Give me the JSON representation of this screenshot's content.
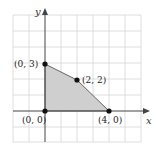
{
  "diagram": {
    "type": "feasible-region-plot",
    "axes": {
      "x_label": "x",
      "y_label": "y"
    },
    "grid": {
      "x_min": -2,
      "x_max": 6,
      "y_min": -2,
      "y_max": 5,
      "step": 1
    },
    "region_fill": "#cccccc",
    "vertices": [
      {
        "x": 0,
        "y": 0,
        "label": "(0, 0)"
      },
      {
        "x": 0,
        "y": 3,
        "label": "(0, 3)"
      },
      {
        "x": 2,
        "y": 2,
        "label": "(2, 2)"
      },
      {
        "x": 4,
        "y": 0,
        "label": "(4, 0)"
      }
    ]
  }
}
